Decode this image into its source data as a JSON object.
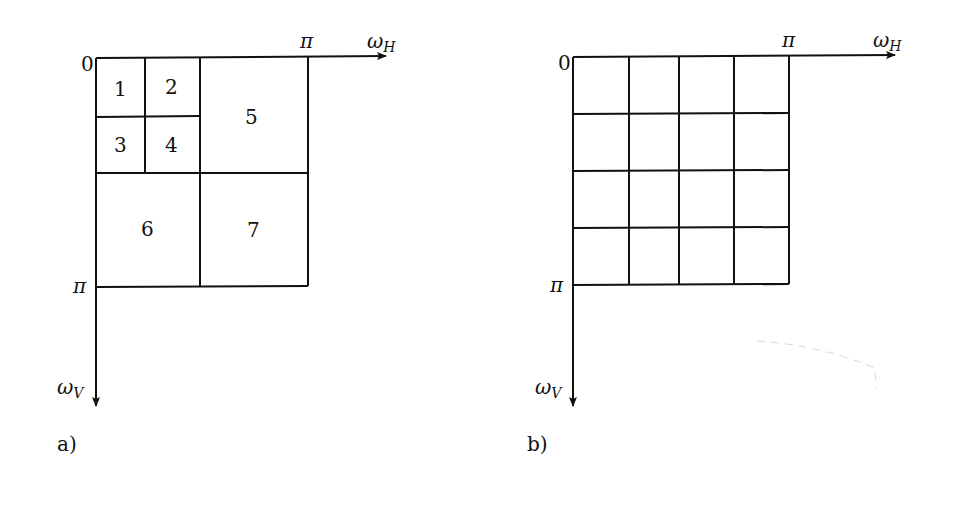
{
  "figure": {
    "colors": {
      "line": "#111111",
      "background": "#ffffff"
    },
    "panels": [
      {
        "id": "a",
        "caption": "a)",
        "origin_label": "0",
        "h_axis": {
          "symbol": "ω",
          "subscript": "H",
          "tick_label": "π"
        },
        "v_axis": {
          "symbol": "ω",
          "subscript": "V",
          "tick_label": "π"
        },
        "decomposition": "wavelet (dyadic)",
        "regions": [
          {
            "label": "1"
          },
          {
            "label": "2"
          },
          {
            "label": "3"
          },
          {
            "label": "4"
          },
          {
            "label": "5"
          },
          {
            "label": "6"
          },
          {
            "label": "7"
          }
        ]
      },
      {
        "id": "b",
        "caption": "b)",
        "origin_label": "0",
        "h_axis": {
          "symbol": "ω",
          "subscript": "H",
          "tick_label": "π"
        },
        "v_axis": {
          "symbol": "ω",
          "subscript": "V",
          "tick_label": "π"
        },
        "decomposition": "uniform 4x4 subbands",
        "grid": {
          "rows": 4,
          "cols": 4
        }
      }
    ]
  }
}
